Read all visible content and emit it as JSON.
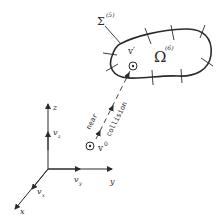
{
  "diagram": {
    "surface_label": "Σ",
    "surface_sup": "(5)",
    "region_label": "Ω",
    "region_sup": "(6)",
    "point_after": "v′",
    "point_before": "v",
    "point_before_sup": "0",
    "path_label_left": "near",
    "path_label_right": "collision",
    "axes": {
      "z": "z",
      "y": "y",
      "x": "x",
      "vz": "v",
      "vz_sub": "z",
      "vy": "v",
      "vy_sub": "y",
      "vx": "v",
      "vx_sub": "x"
    },
    "colors": {
      "ink": "#2a2a2a",
      "background": "#ffffff"
    }
  }
}
